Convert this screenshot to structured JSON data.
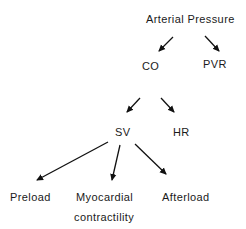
{
  "diagram": {
    "nodes": {
      "arterial_pressure": "Arterial Pressure",
      "co": "CO",
      "pvr": "PVR",
      "sv": "SV",
      "hr": "HR",
      "preload": "Preload",
      "myocardial_line1": "Myocardial",
      "myocardial_line2": "contractility",
      "afterload": "Afterload"
    },
    "edges": [
      {
        "from": "Arterial Pressure",
        "to": "CO"
      },
      {
        "from": "Arterial Pressure",
        "to": "PVR"
      },
      {
        "from": "CO",
        "to": "SV"
      },
      {
        "from": "CO",
        "to": "HR"
      },
      {
        "from": "SV",
        "to": "Preload"
      },
      {
        "from": "SV",
        "to": "Myocardial contractility"
      },
      {
        "from": "SV",
        "to": "Afterload"
      }
    ],
    "colors": {
      "text": "#1a1a1a",
      "arrow": "#111111",
      "background": "#ffffff"
    }
  }
}
